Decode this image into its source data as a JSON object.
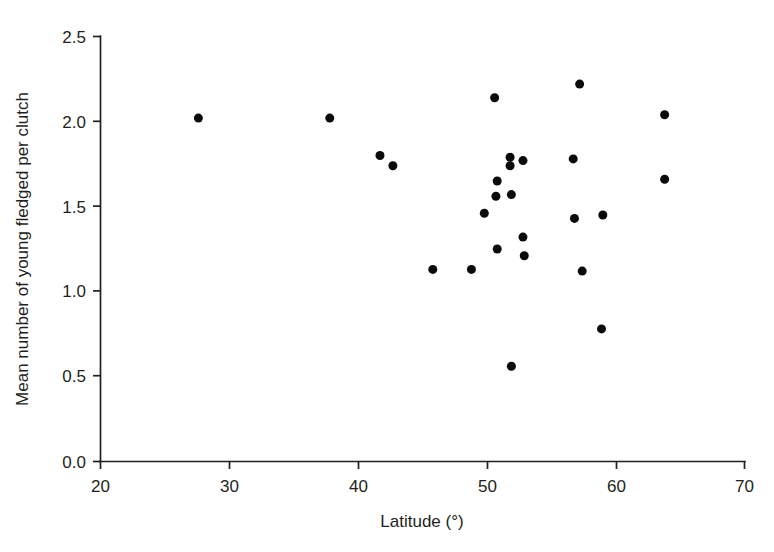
{
  "chart_data": {
    "type": "scatter",
    "title": "",
    "xlabel": "Latitude (°)",
    "ylabel": "Mean number of young fledged per clutch",
    "xlim": [
      20,
      70
    ],
    "ylim": [
      0.0,
      2.5
    ],
    "xticks": [
      "20",
      "30",
      "40",
      "50",
      "60",
      "70"
    ],
    "xtick_values": [
      20,
      30,
      40,
      50,
      60,
      70
    ],
    "yticks": [
      "0.0",
      "0.5",
      "1.0",
      "1.5",
      "2.0",
      "2.5"
    ],
    "ytick_values": [
      0.0,
      0.5,
      1.0,
      1.5,
      2.0,
      2.5
    ],
    "grid": false,
    "legend": false,
    "marker": "filled-circle",
    "marker_color": "#0a0a0a",
    "marker_size_px": 9,
    "n_points": 29,
    "points": [
      {
        "x": 27.6,
        "y": 2.02
      },
      {
        "x": 37.8,
        "y": 2.02
      },
      {
        "x": 41.7,
        "y": 1.8
      },
      {
        "x": 42.7,
        "y": 1.74
      },
      {
        "x": 45.8,
        "y": 1.13
      },
      {
        "x": 48.8,
        "y": 1.13
      },
      {
        "x": 49.8,
        "y": 1.46
      },
      {
        "x": 50.6,
        "y": 2.14
      },
      {
        "x": 50.7,
        "y": 1.56
      },
      {
        "x": 50.8,
        "y": 1.65
      },
      {
        "x": 50.8,
        "y": 1.25
      },
      {
        "x": 51.8,
        "y": 1.79
      },
      {
        "x": 51.8,
        "y": 1.74
      },
      {
        "x": 51.9,
        "y": 1.57
      },
      {
        "x": 51.9,
        "y": 0.56
      },
      {
        "x": 52.8,
        "y": 1.77
      },
      {
        "x": 52.8,
        "y": 1.32
      },
      {
        "x": 52.9,
        "y": 1.21
      },
      {
        "x": 56.7,
        "y": 1.78
      },
      {
        "x": 56.8,
        "y": 1.43
      },
      {
        "x": 57.2,
        "y": 2.22
      },
      {
        "x": 57.4,
        "y": 1.12
      },
      {
        "x": 58.9,
        "y": 0.78
      },
      {
        "x": 59.0,
        "y": 1.45
      },
      {
        "x": 63.8,
        "y": 2.04
      },
      {
        "x": 63.8,
        "y": 1.66
      }
    ]
  },
  "axes": {
    "x_axis_name": "latitude-axis",
    "y_axis_name": "fledging-success-axis"
  }
}
